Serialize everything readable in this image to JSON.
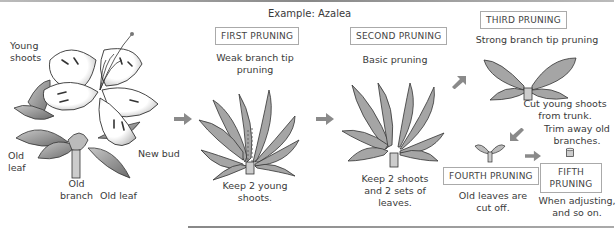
{
  "title": "Example: Azalea",
  "labels": {
    "young_shoots": [
      "Young",
      "shoots"
    ],
    "old_leaf_left": [
      "Old",
      "leaf"
    ],
    "old_branch": [
      "Old",
      "branch"
    ],
    "old_leaf_bottom": "Old leaf",
    "new_bud": "New bud"
  },
  "steps": [
    {
      "name": "FIRST PRUNING",
      "desc": [
        "Weak branch tip",
        "pruning"
      ],
      "note": [
        "Keep 2 young",
        "shoots."
      ]
    },
    {
      "name": "SECOND PRUNING",
      "desc": [
        "Basic pruning"
      ],
      "note": [
        "Keep 2 shoots",
        "and 2 sets of",
        "leaves."
      ]
    },
    {
      "name": "THIRD PRUNING",
      "desc": [
        "Strong branch tip pruning"
      ],
      "note": [
        "Cut young shoots",
        "from trunk."
      ]
    },
    {
      "name": "FOURTH PRUNING",
      "desc": [
        "Old leaves are",
        "cut off."
      ],
      "note": []
    },
    {
      "name": "FIFTH PRUNING",
      "name_lines": [
        "FIFTH",
        "PRUNING"
      ],
      "desc": [
        "When adjusting,",
        "and so on."
      ],
      "note": [
        "Trim away old",
        "branches."
      ]
    }
  ],
  "colors": {
    "arrow": "#8a8a8a",
    "leaf": "#9a9a9a",
    "leaf_dark": "#6d6d6d",
    "outline": "#333333"
  }
}
